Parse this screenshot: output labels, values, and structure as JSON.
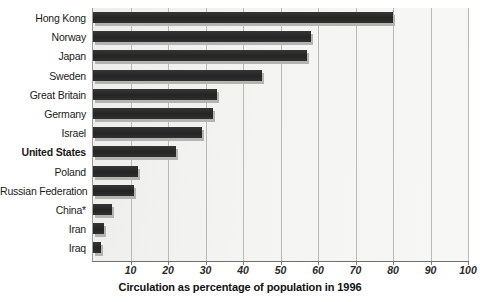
{
  "chart_data": {
    "type": "bar",
    "orientation": "horizontal",
    "title": "",
    "xlabel": "Circulation as percentage of population in 1996",
    "ylabel": "",
    "xlim": [
      0,
      100
    ],
    "xticks": [
      10,
      20,
      30,
      40,
      50,
      60,
      70,
      80,
      90,
      100
    ],
    "grid": true,
    "legend": "none",
    "categories": [
      "Hong Kong",
      "Norway",
      "Japan",
      "Sweden",
      "Great Britain",
      "Germany",
      "Israel",
      "United States",
      "Poland",
      "Russian Federation",
      "China*",
      "Iran",
      "Iraq"
    ],
    "values": [
      80,
      58,
      57,
      45,
      33,
      32,
      29,
      22,
      12,
      11,
      5,
      3,
      2
    ],
    "highlight_category": "United States",
    "bar_color": "#2b2b2b",
    "shadow_color": "#b4b4b1",
    "plot_background": "#f2f2f0",
    "gridline_color": "#b9b9b6"
  },
  "axis": {
    "title": "Circulation as percentage of population in 1996",
    "tick_labels": [
      "10",
      "20",
      "30",
      "40",
      "50",
      "60",
      "70",
      "80",
      "90",
      "100"
    ]
  }
}
